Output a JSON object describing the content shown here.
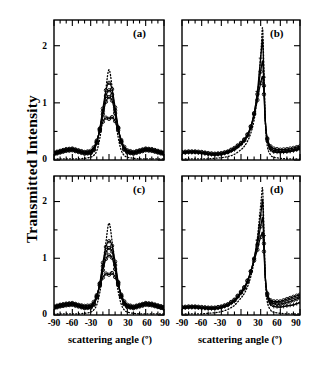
{
  "figure": {
    "ylabel": "Transmitted Intensity",
    "xlabel_left": "scattering angle (º)",
    "xlabel_right": "scattering angle (º)",
    "panel_labels": [
      "(a)",
      "(b)",
      "(c)",
      "(d)"
    ],
    "yticks": [
      "0",
      "1",
      "2"
    ],
    "xticks": [
      "-90",
      "-60",
      "-30",
      "0",
      "30",
      "60",
      "90"
    ],
    "accent": "#000000",
    "background": "#ffffff"
  },
  "chart_data": [
    {
      "type": "line",
      "panel": "(a)",
      "title": "",
      "xlabel": "scattering angle (º)",
      "ylabel": "Transmitted Intensity",
      "xlim": [
        -90,
        90
      ],
      "ylim": [
        0,
        2.45
      ],
      "xticks": [
        -90,
        -60,
        -30,
        0,
        30,
        60,
        90
      ],
      "xticks_minor_step": 10,
      "yticks": [
        0,
        1,
        2
      ],
      "yticks_minor_step": 0.5,
      "grid": false,
      "legend": "none",
      "x": [
        -90,
        -80,
        -70,
        -60,
        -50,
        -40,
        -30,
        -25,
        -20,
        -15,
        -10,
        -5,
        0,
        5,
        10,
        15,
        20,
        25,
        30,
        40,
        50,
        60,
        70,
        80,
        90
      ],
      "series": [
        {
          "name": "dotted-theory",
          "style": "dotted",
          "marker": "none",
          "values": [
            0.02,
            0.02,
            0.02,
            0.02,
            0.02,
            0.03,
            0.05,
            0.08,
            0.16,
            0.38,
            0.75,
            1.25,
            1.58,
            1.28,
            0.78,
            0.4,
            0.17,
            0.08,
            0.05,
            0.03,
            0.02,
            0.02,
            0.02,
            0.02,
            0.02
          ]
        },
        {
          "name": "solid-1",
          "style": "solid",
          "marker": "circle",
          "values": [
            0.1,
            0.13,
            0.16,
            0.17,
            0.14,
            0.11,
            0.12,
            0.17,
            0.3,
            0.55,
            0.9,
            1.22,
            1.35,
            1.24,
            0.92,
            0.57,
            0.31,
            0.18,
            0.13,
            0.11,
            0.14,
            0.17,
            0.16,
            0.13,
            0.1
          ]
        },
        {
          "name": "solid-2",
          "style": "solid",
          "marker": "circle",
          "values": [
            0.11,
            0.14,
            0.17,
            0.18,
            0.15,
            0.12,
            0.13,
            0.18,
            0.31,
            0.54,
            0.85,
            1.12,
            1.22,
            1.14,
            0.87,
            0.56,
            0.32,
            0.19,
            0.14,
            0.12,
            0.15,
            0.18,
            0.17,
            0.14,
            0.11
          ]
        },
        {
          "name": "solid-3",
          "style": "solid",
          "marker": "circle",
          "values": [
            0.12,
            0.15,
            0.18,
            0.19,
            0.16,
            0.13,
            0.14,
            0.19,
            0.32,
            0.53,
            0.8,
            1.02,
            1.1,
            1.04,
            0.82,
            0.55,
            0.33,
            0.2,
            0.15,
            0.13,
            0.16,
            0.19,
            0.18,
            0.15,
            0.12
          ]
        },
        {
          "name": "solid-4",
          "style": "solid",
          "marker": "circle",
          "values": [
            0.13,
            0.16,
            0.19,
            0.2,
            0.17,
            0.14,
            0.16,
            0.22,
            0.34,
            0.51,
            0.67,
            0.74,
            0.72,
            0.75,
            0.68,
            0.52,
            0.35,
            0.23,
            0.17,
            0.14,
            0.17,
            0.2,
            0.19,
            0.16,
            0.13
          ]
        }
      ]
    },
    {
      "type": "line",
      "panel": "(b)",
      "title": "",
      "xlabel": "scattering angle (º)",
      "ylabel": "Transmitted Intensity",
      "xlim": [
        -90,
        90
      ],
      "ylim": [
        0,
        2.45
      ],
      "xticks": [
        -90,
        -60,
        -30,
        0,
        30,
        60,
        90
      ],
      "xticks_minor_step": 10,
      "yticks": [
        0,
        1,
        2
      ],
      "yticks_minor_step": 0.5,
      "grid": false,
      "legend": "none",
      "peak_angle": 33,
      "x": [
        -90,
        -80,
        -70,
        -60,
        -50,
        -40,
        -30,
        -20,
        -10,
        0,
        5,
        10,
        15,
        20,
        25,
        28,
        31,
        33,
        35,
        37,
        40,
        45,
        50,
        60,
        70,
        80,
        90
      ],
      "series": [
        {
          "name": "dotted-theory",
          "style": "dotted",
          "marker": "none",
          "values": [
            0.02,
            0.02,
            0.02,
            0.02,
            0.02,
            0.03,
            0.04,
            0.06,
            0.1,
            0.18,
            0.24,
            0.33,
            0.47,
            0.7,
            1.1,
            1.5,
            2.0,
            2.3,
            1.55,
            0.7,
            0.25,
            0.09,
            0.05,
            0.03,
            0.02,
            0.02,
            0.02
          ]
        },
        {
          "name": "solid-1",
          "style": "solid",
          "marker": "cross",
          "values": [
            0.12,
            0.13,
            0.13,
            0.12,
            0.1,
            0.09,
            0.1,
            0.13,
            0.18,
            0.27,
            0.33,
            0.42,
            0.56,
            0.8,
            1.2,
            1.55,
            1.9,
            2.1,
            1.45,
            0.72,
            0.33,
            0.18,
            0.14,
            0.13,
            0.14,
            0.16,
            0.19
          ]
        },
        {
          "name": "solid-2",
          "style": "solid",
          "marker": "circle",
          "values": [
            0.13,
            0.14,
            0.14,
            0.13,
            0.11,
            0.1,
            0.11,
            0.14,
            0.2,
            0.29,
            0.35,
            0.44,
            0.58,
            0.82,
            1.15,
            1.4,
            1.62,
            1.72,
            1.3,
            0.7,
            0.36,
            0.21,
            0.17,
            0.15,
            0.16,
            0.18,
            0.21
          ]
        },
        {
          "name": "solid-3",
          "style": "solid",
          "marker": "circle",
          "values": [
            0.14,
            0.15,
            0.15,
            0.14,
            0.12,
            0.11,
            0.12,
            0.15,
            0.21,
            0.3,
            0.36,
            0.45,
            0.59,
            0.8,
            1.05,
            1.24,
            1.4,
            1.45,
            1.15,
            0.68,
            0.38,
            0.24,
            0.2,
            0.18,
            0.19,
            0.21,
            0.24
          ]
        }
      ]
    },
    {
      "type": "line",
      "panel": "(c)",
      "title": "",
      "xlabel": "scattering angle (º)",
      "ylabel": "Transmitted Intensity",
      "xlim": [
        -90,
        90
      ],
      "ylim": [
        0,
        2.45
      ],
      "xticks": [
        -90,
        -60,
        -30,
        0,
        30,
        60,
        90
      ],
      "xticks_minor_step": 10,
      "yticks": [
        0,
        1,
        2
      ],
      "yticks_minor_step": 0.5,
      "grid": false,
      "legend": "none",
      "x": [
        -90,
        -80,
        -70,
        -60,
        -50,
        -40,
        -30,
        -25,
        -20,
        -15,
        -10,
        -5,
        0,
        5,
        10,
        15,
        20,
        25,
        30,
        40,
        50,
        60,
        70,
        80,
        90
      ],
      "series": [
        {
          "name": "dotted-theory",
          "style": "dotted",
          "marker": "none",
          "values": [
            0.02,
            0.02,
            0.02,
            0.02,
            0.02,
            0.03,
            0.05,
            0.09,
            0.18,
            0.4,
            0.78,
            1.28,
            1.62,
            1.3,
            0.8,
            0.42,
            0.19,
            0.09,
            0.05,
            0.03,
            0.02,
            0.02,
            0.02,
            0.02,
            0.02
          ]
        },
        {
          "name": "solid-1",
          "style": "solid",
          "marker": "circle",
          "values": [
            0.12,
            0.15,
            0.17,
            0.18,
            0.15,
            0.12,
            0.13,
            0.18,
            0.31,
            0.56,
            0.92,
            1.2,
            1.3,
            1.22,
            0.94,
            0.58,
            0.32,
            0.19,
            0.14,
            0.12,
            0.15,
            0.18,
            0.17,
            0.14,
            0.11
          ]
        },
        {
          "name": "solid-2",
          "style": "solid",
          "marker": "circle",
          "values": [
            0.13,
            0.16,
            0.18,
            0.19,
            0.16,
            0.13,
            0.14,
            0.19,
            0.32,
            0.55,
            0.86,
            1.1,
            1.18,
            1.12,
            0.88,
            0.57,
            0.33,
            0.2,
            0.15,
            0.13,
            0.16,
            0.19,
            0.18,
            0.15,
            0.12
          ]
        },
        {
          "name": "solid-3",
          "style": "solid",
          "marker": "circle",
          "values": [
            0.14,
            0.17,
            0.19,
            0.2,
            0.17,
            0.14,
            0.15,
            0.2,
            0.33,
            0.53,
            0.79,
            0.99,
            1.05,
            1.01,
            0.81,
            0.55,
            0.34,
            0.21,
            0.16,
            0.14,
            0.17,
            0.2,
            0.19,
            0.16,
            0.13
          ]
        },
        {
          "name": "solid-4",
          "style": "solid",
          "marker": "circle",
          "values": [
            0.15,
            0.18,
            0.2,
            0.21,
            0.18,
            0.16,
            0.17,
            0.23,
            0.35,
            0.52,
            0.66,
            0.73,
            0.71,
            0.74,
            0.67,
            0.53,
            0.36,
            0.24,
            0.18,
            0.15,
            0.18,
            0.21,
            0.2,
            0.17,
            0.14
          ]
        }
      ]
    },
    {
      "type": "line",
      "panel": "(d)",
      "title": "",
      "xlabel": "scattering angle (º)",
      "ylabel": "Transmitted Intensity",
      "xlim": [
        -90,
        90
      ],
      "ylim": [
        0,
        2.45
      ],
      "xticks": [
        -90,
        -60,
        -30,
        0,
        30,
        60,
        90
      ],
      "xticks_minor_step": 10,
      "yticks": [
        0,
        1,
        2
      ],
      "yticks_minor_step": 0.5,
      "grid": false,
      "legend": "none",
      "peak_angle": 33,
      "x": [
        -90,
        -80,
        -70,
        -60,
        -50,
        -40,
        -30,
        -20,
        -10,
        0,
        5,
        10,
        15,
        20,
        25,
        28,
        31,
        33,
        35,
        37,
        40,
        45,
        50,
        60,
        70,
        80,
        90
      ],
      "series": [
        {
          "name": "dotted-theory",
          "style": "dotted",
          "marker": "none",
          "values": [
            0.02,
            0.02,
            0.02,
            0.02,
            0.03,
            0.04,
            0.06,
            0.1,
            0.17,
            0.3,
            0.38,
            0.5,
            0.68,
            0.95,
            1.35,
            1.7,
            2.05,
            2.22,
            1.5,
            0.66,
            0.24,
            0.09,
            0.05,
            0.03,
            0.02,
            0.02,
            0.02
          ]
        },
        {
          "name": "solid-1",
          "style": "solid",
          "marker": "cross",
          "values": [
            0.12,
            0.13,
            0.13,
            0.12,
            0.11,
            0.11,
            0.13,
            0.17,
            0.24,
            0.38,
            0.46,
            0.58,
            0.76,
            1.0,
            1.32,
            1.58,
            1.85,
            2.02,
            1.4,
            0.7,
            0.33,
            0.19,
            0.15,
            0.14,
            0.16,
            0.18,
            0.22
          ]
        },
        {
          "name": "solid-2",
          "style": "solid",
          "marker": "circle",
          "values": [
            0.13,
            0.14,
            0.14,
            0.13,
            0.12,
            0.12,
            0.14,
            0.18,
            0.26,
            0.4,
            0.48,
            0.6,
            0.77,
            0.99,
            1.24,
            1.44,
            1.62,
            1.7,
            1.26,
            0.68,
            0.36,
            0.23,
            0.2,
            0.19,
            0.22,
            0.26,
            0.31
          ]
        },
        {
          "name": "solid-3",
          "style": "solid",
          "marker": "circle",
          "values": [
            0.14,
            0.15,
            0.15,
            0.14,
            0.13,
            0.13,
            0.15,
            0.19,
            0.27,
            0.41,
            0.49,
            0.61,
            0.77,
            0.96,
            1.15,
            1.3,
            1.41,
            1.44,
            1.12,
            0.66,
            0.38,
            0.26,
            0.24,
            0.24,
            0.28,
            0.32,
            0.36
          ]
        }
      ]
    }
  ]
}
